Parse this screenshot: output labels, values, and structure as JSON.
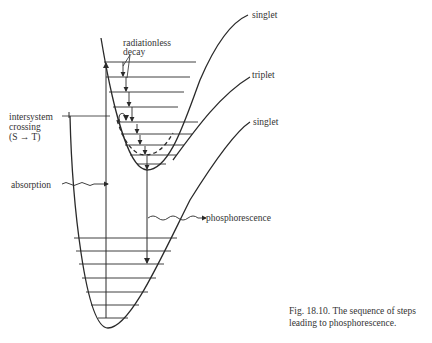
{
  "figure": {
    "labels": {
      "singlet_upper": "singlet",
      "triplet": "triplet",
      "singlet_ground": "singlet",
      "radiationless_1": "radiationless",
      "radiationless_2": "decay",
      "isc_1": "intersystem",
      "isc_2": "crossing",
      "isc_3": "(S → T)",
      "absorption": "absorption",
      "phosphorescence": "phosphorescence"
    },
    "caption": "Fig. 18.10. The sequence of steps leading to phosphorescence."
  },
  "colors": {
    "line": "#2a2a2a",
    "text": "#333333",
    "background": "#ffffff"
  }
}
